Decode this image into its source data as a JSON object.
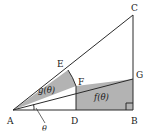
{
  "figure": {
    "name": "geometric-diagram-sector-triangle",
    "background": "#ffffff",
    "stroke_color": "#2b2b2b",
    "fill_color": "#b3b3b3",
    "width": 157,
    "height": 133,
    "points": {
      "A": {
        "label": "A",
        "x": 13,
        "y": 110
      },
      "B": {
        "label": "B",
        "x": 133,
        "y": 110
      },
      "C": {
        "label": "C",
        "x": 133,
        "y": 15
      },
      "D": {
        "label": "D",
        "x": 76,
        "y": 110
      },
      "E": {
        "label": "E",
        "x": 68,
        "y": 70
      },
      "F": {
        "label": "F",
        "x": 76,
        "y": 86
      },
      "G": {
        "label": "G",
        "x": 133,
        "y": 79
      }
    },
    "point_labels": {
      "A": {
        "text": "A",
        "x": 7,
        "y": 124
      },
      "B": {
        "text": "B",
        "x": 132,
        "y": 124
      },
      "C": {
        "text": "C",
        "x": 132,
        "y": 11
      },
      "D": {
        "text": "D",
        "x": 72,
        "y": 124
      },
      "E": {
        "text": "E",
        "x": 58,
        "y": 67
      },
      "F": {
        "text": "F",
        "x": 78,
        "y": 84
      },
      "G": {
        "text": "G",
        "x": 136,
        "y": 78
      }
    },
    "region_labels": {
      "g": {
        "text": "g(θ)",
        "x": 40,
        "y": 92
      },
      "f": {
        "text": "f(θ)",
        "x": 97,
        "y": 99
      }
    },
    "angle_label": {
      "text": "θ",
      "x": 43,
      "y": 130
    },
    "marks": {
      "right_angle_at": "B",
      "angle_arc_at": "A"
    }
  }
}
